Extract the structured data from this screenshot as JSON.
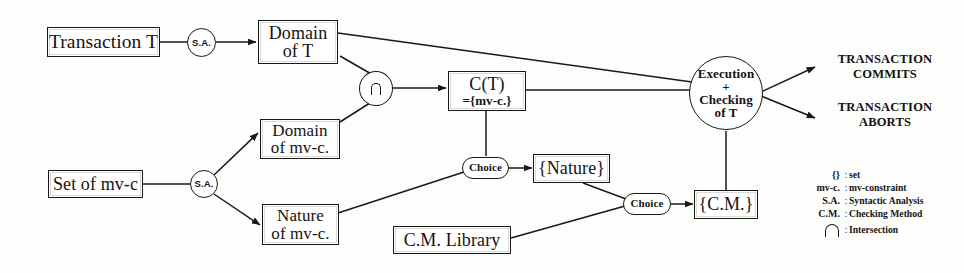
{
  "diagram": {
    "nodes": {
      "transaction_t": "Transaction T",
      "sa_top": "S.A.",
      "domain_of_t_line1": "Domain",
      "domain_of_t_line2": "of T",
      "intersection_symbol": "∩",
      "ct_line1": "C(T)",
      "ct_line2": "={mv-c.}",
      "execution_line1": "Execution",
      "execution_line2": "+",
      "execution_line3": "Checking",
      "execution_line4": "of T",
      "set_of_mvc": "Set of mv-c",
      "sa_bottom": "S.A.",
      "domain_of_mvc_line1": "Domain",
      "domain_of_mvc_line2": "of mv-c.",
      "nature_of_mvc_line1": "Nature",
      "nature_of_mvc_line2": "of mv-c.",
      "choice_nature": "Choice",
      "set_nature": "{Nature}",
      "choice_cm": "Choice",
      "set_cm": "{C.M.}",
      "cm_library": "C.M. Library"
    },
    "outcomes": {
      "commit_line1": "TRANSACTION",
      "commit_line2": "COMMITS",
      "abort_line1": "TRANSACTION",
      "abort_line2": "ABORTS"
    },
    "legend": {
      "rows": [
        {
          "symbol": "{}",
          "separator": ":",
          "description": "set"
        },
        {
          "symbol": "mv-c.",
          "separator": ":",
          "description": "mv-constraint"
        },
        {
          "symbol": "S.A.",
          "separator": ":",
          "description": "Syntactic  Analysis"
        },
        {
          "symbol": "C.M.",
          "separator": ":",
          "description": "Checking Method"
        },
        {
          "symbol": "∩",
          "separator": ":",
          "description": "Intersection"
        }
      ]
    },
    "colors": {
      "ink": "#181818",
      "paper": "#fdfdfc"
    }
  }
}
